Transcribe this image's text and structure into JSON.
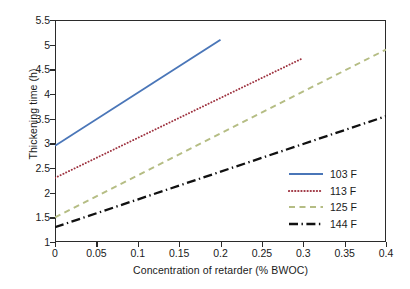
{
  "chart_data": {
    "type": "line",
    "title": "",
    "xlabel": "Concentration of retarder (% BWOC)",
    "ylabel": "Thickening time (h)",
    "xlim": [
      0,
      0.4
    ],
    "ylim": [
      1,
      5.5
    ],
    "xticks": [
      "0",
      "0.05",
      "0.1",
      "0.15",
      "0.2",
      "0.25",
      "0.3",
      "0.35",
      "0.4"
    ],
    "xtick_values": [
      0,
      0.05,
      0.1,
      0.15,
      0.2,
      0.25,
      0.3,
      0.35,
      0.4
    ],
    "yticks": [
      "1",
      "1.5",
      "2",
      "2.5",
      "3",
      "3.5",
      "4",
      "4.5",
      "5",
      "5.5"
    ],
    "ytick_values": [
      1,
      1.5,
      2,
      2.5,
      3,
      3.5,
      4,
      4.5,
      5,
      5.5
    ],
    "grid": false,
    "legend_position": "lower-right",
    "series": [
      {
        "name": "103 F",
        "color": "#4a76b8",
        "style": "solid",
        "x": [
          0,
          0.2
        ],
        "y": [
          2.95,
          5.1
        ]
      },
      {
        "name": "113 F",
        "color": "#9e3340",
        "style": "dotted",
        "x": [
          0,
          0.3
        ],
        "y": [
          2.3,
          4.73
        ]
      },
      {
        "name": "125 F",
        "color": "#b5bd84",
        "style": "dashed",
        "x": [
          0,
          0.4
        ],
        "y": [
          1.5,
          4.9
        ]
      },
      {
        "name": "144 F",
        "color": "#111111",
        "style": "dashdot",
        "x": [
          0,
          0.4
        ],
        "y": [
          1.3,
          3.55
        ]
      }
    ]
  },
  "figure": {
    "background": "#ffffff",
    "frame_color": "#2b2b2b",
    "text_color": "#1a1a1a",
    "caption_fragment": ""
  }
}
